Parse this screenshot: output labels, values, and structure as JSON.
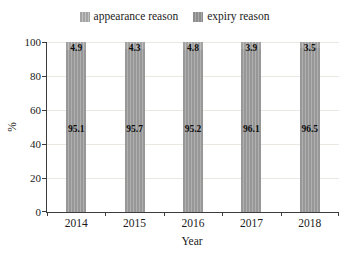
{
  "legend": {
    "items": [
      {
        "label": "appearance reason",
        "color": "#a3a3a3",
        "stripe": "#c0c0c0"
      },
      {
        "label": "expiry reason",
        "color": "#8d8d8d",
        "stripe": "#a8a8a8"
      }
    ]
  },
  "chart_data": {
    "type": "bar",
    "stacked": true,
    "title": "",
    "categories": [
      "2014",
      "2015",
      "2016",
      "2017",
      "2018"
    ],
    "series": [
      {
        "name": "expiry reason",
        "values": [
          95.1,
          95.7,
          95.2,
          96.1,
          96.5
        ],
        "color": "#979797",
        "stripe": "#b0b0b0"
      },
      {
        "name": "appearance reason",
        "values": [
          4.9,
          4.3,
          4.8,
          3.9,
          3.5
        ],
        "color": "#a2a2a2",
        "stripe": "#bdbdbd"
      }
    ],
    "xlabel": "Year",
    "ylabel": "%",
    "ylim": [
      0,
      100
    ],
    "yticks": [
      0,
      20,
      40,
      60,
      80,
      100
    ],
    "grid": true,
    "grid_color": "#eae8e1",
    "axis_color": "#3c3c3c",
    "legend_position": "top center"
  }
}
